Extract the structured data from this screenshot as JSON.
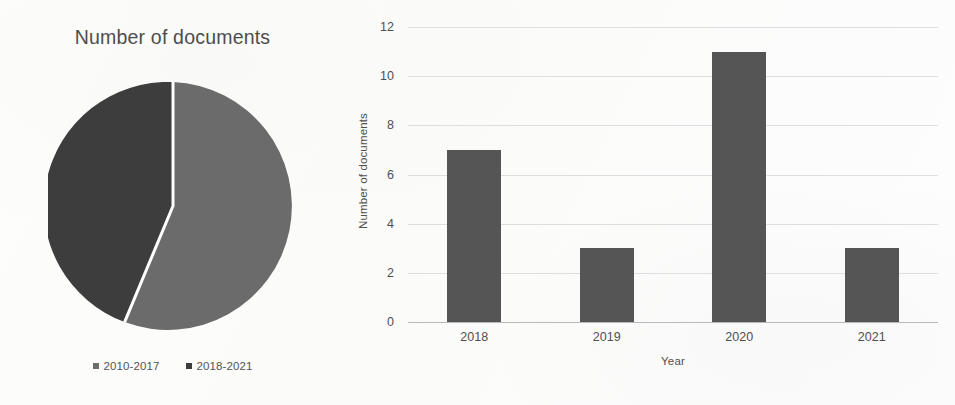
{
  "pie": {
    "title": "Number of documents",
    "legend": [
      {
        "label": "2010-2017",
        "color": "#6b6b6b"
      },
      {
        "label": "2018-2021",
        "color": "#3d3d3d"
      }
    ]
  },
  "bar": {
    "ylabel": "Number of documents",
    "xlabel": "Year"
  },
  "chart_data": [
    {
      "type": "pie",
      "title": "Number of documents",
      "labels": [
        "2010-2017",
        "2018-2021"
      ],
      "values": [
        56,
        44
      ],
      "value_unit": "percent",
      "colors": [
        "#6b6b6b",
        "#3d3d3d"
      ],
      "start_angle_deg": 0,
      "direction": "clockwise",
      "separator_color": "#ffffff",
      "legend_position": "bottom",
      "grid": false
    },
    {
      "type": "bar",
      "title": "",
      "categories": [
        "2018",
        "2019",
        "2020",
        "2021"
      ],
      "values": [
        7,
        3,
        11,
        3
      ],
      "series": [
        {
          "name": "Number of documents",
          "values": [
            7,
            3,
            11,
            3
          ]
        }
      ],
      "xlabel": "Year",
      "ylabel": "Number of documents",
      "ylim": [
        0,
        12
      ],
      "ytick_step": 2,
      "yticks": [
        0,
        2,
        4,
        6,
        8,
        10,
        12
      ],
      "bar_color": "#555555",
      "grid": true,
      "grid_axis": "y",
      "legend_position": "none"
    }
  ]
}
